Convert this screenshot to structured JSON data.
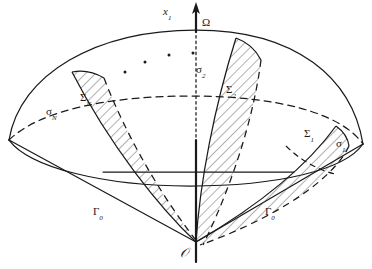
{
  "figure": {
    "kind": "geometric-diagram",
    "width": 372,
    "height": 269,
    "background_color": "#ffffff",
    "stroke_color": "#1a1a1a",
    "hatch_color": "#555555"
  },
  "labels": {
    "axis": {
      "base": "x",
      "sub": "1"
    },
    "domain": {
      "text": "Ω"
    },
    "origin": {
      "text": "𝒪"
    },
    "sigma_2": {
      "base": "σ",
      "sub": "2"
    },
    "sigma_1": {
      "base": "σ",
      "sub": "1"
    },
    "sigma_N": {
      "base": "σ",
      "sub": "N"
    },
    "Sigma_2": {
      "base": "Σ",
      "sub": "2"
    },
    "Sigma_1": {
      "base": "Σ",
      "sub": "1"
    },
    "Sigma_N": {
      "base": "Σ",
      "sub": "N"
    },
    "gamma_left": {
      "base": "Γ",
      "sub": "0"
    },
    "gamma_right": {
      "base": "Γ",
      "sub": "0"
    }
  },
  "label_positions": {
    "axis": {
      "x": 163,
      "y": 6
    },
    "domain": {
      "x": 202,
      "y": 17
    },
    "origin": {
      "x": 187,
      "y": 249
    },
    "sigma_2": {
      "x": 196,
      "y": 64
    },
    "sigma_1": {
      "x": 336,
      "y": 138
    },
    "sigma_N": {
      "x": 46,
      "y": 106
    },
    "Sigma_2": {
      "x": 226,
      "y": 84
    },
    "Sigma_1": {
      "x": 304,
      "y": 128
    },
    "Sigma_N": {
      "x": 80,
      "y": 92
    },
    "gamma_left": {
      "x": 93,
      "y": 206
    },
    "gamma_right": {
      "x": 265,
      "y": 206
    }
  },
  "ellipsis_dots": [
    {
      "x": 125,
      "y": 72
    },
    {
      "x": 145,
      "y": 62
    },
    {
      "x": 169,
      "y": 55
    },
    {
      "x": 193,
      "y": 53
    }
  ],
  "geometry_notes": {
    "apex": {
      "x": 196,
      "y": 242
    },
    "dome_apex": {
      "x": 196,
      "y": 30
    },
    "equator_left": {
      "x": 9,
      "y": 140
    },
    "equator_right": {
      "x": 363,
      "y": 144
    },
    "equator_back_top_y": 112,
    "equator_front_bottom_y": 176,
    "cone_base_line_y": 172,
    "lobe_count_visible": 3
  }
}
